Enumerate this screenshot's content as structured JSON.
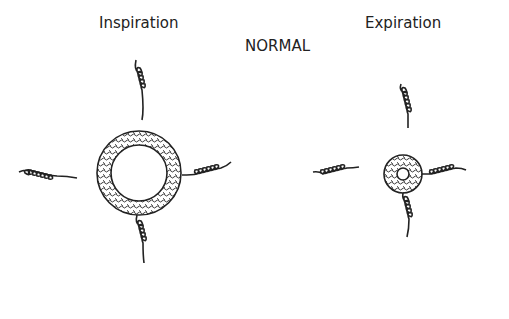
{
  "labels": {
    "inspiration": "Inspiration",
    "expiration": "Expiration",
    "normal": "NORMAL"
  },
  "figures": [
    {
      "name": "inspiration-airway",
      "state": "dilated",
      "center": [
        139,
        173
      ],
      "outer_radius": 42,
      "inner_radius": 28
    },
    {
      "name": "expiration-airway",
      "state": "narrowed",
      "center": [
        403,
        174
      ],
      "outer_radius": 19,
      "inner_radius": 6
    }
  ]
}
